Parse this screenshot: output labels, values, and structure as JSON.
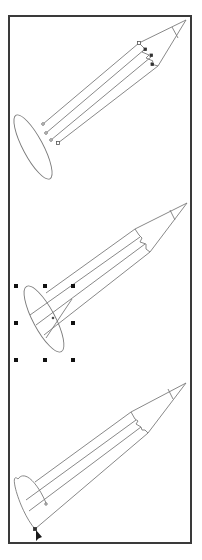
{
  "canvas": {
    "background": "#ffffff",
    "frame_color": "#3a3a3a",
    "stroke_color": "#7a7a7a",
    "handle_color": "#111111"
  },
  "steps": [
    {
      "name": "pencil-with-anchor-points",
      "state": "direct-selection",
      "shapes": [
        "pencil-body",
        "pencil-tip",
        "ellipse"
      ]
    },
    {
      "name": "pencil-with-selected-ellipse",
      "state": "bounding-box-selected",
      "handles": 8
    },
    {
      "name": "pencil-with-trimmed-end",
      "state": "anchor-edit",
      "cursor": "direct-selection-arrow"
    }
  ]
}
